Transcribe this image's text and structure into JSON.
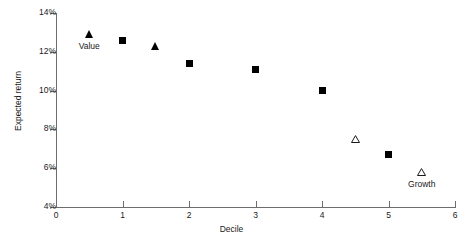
{
  "chart_data": {
    "type": "scatter",
    "title": "",
    "xlabel": "Decile",
    "ylabel": "Expected return",
    "xlim": [
      0,
      6
    ],
    "ylim": [
      4,
      14
    ],
    "xticks": [
      "0",
      "1",
      "2",
      "3",
      "4",
      "5",
      "6"
    ],
    "yticks": [
      "4%",
      "6%",
      "8%",
      "10%",
      "12%",
      "14%"
    ],
    "grid": false,
    "legend": "none",
    "series": [
      {
        "name": "Value",
        "marker": "filled-triangle",
        "color": "#000000",
        "points": [
          {
            "x": 0.5,
            "y": 12.9
          },
          {
            "x": 1.5,
            "y": 12.3
          }
        ]
      },
      {
        "name": "Blend",
        "marker": "filled-square",
        "color": "#000000",
        "points": [
          {
            "x": 1.0,
            "y": 12.6
          },
          {
            "x": 2.0,
            "y": 11.4
          },
          {
            "x": 3.0,
            "y": 11.1
          },
          {
            "x": 4.0,
            "y": 10.0
          },
          {
            "x": 5.0,
            "y": 6.7
          }
        ]
      },
      {
        "name": "Growth",
        "marker": "open-triangle",
        "color": "#000000",
        "points": [
          {
            "x": 4.5,
            "y": 7.5
          },
          {
            "x": 5.5,
            "y": 5.8
          }
        ]
      }
    ],
    "annotations": [
      {
        "text": "Value",
        "x": 0.5,
        "y": 12.9,
        "position": "below"
      },
      {
        "text": "Growth",
        "x": 5.5,
        "y": 5.8,
        "position": "below"
      }
    ]
  },
  "axes": {
    "y_title": "Expected return",
    "x_title": "Decile",
    "y_ticks": [
      {
        "label": "14%",
        "value": 14
      },
      {
        "label": "12%",
        "value": 12
      },
      {
        "label": "10%",
        "value": 10
      },
      {
        "label": "8%",
        "value": 8
      },
      {
        "label": "6%",
        "value": 6
      },
      {
        "label": "4%",
        "value": 4
      }
    ],
    "x_ticks": [
      {
        "label": "0",
        "value": 0
      },
      {
        "label": "1",
        "value": 1
      },
      {
        "label": "2",
        "value": 2
      },
      {
        "label": "3",
        "value": 3
      },
      {
        "label": "4",
        "value": 4
      },
      {
        "label": "5",
        "value": 5
      },
      {
        "label": "6",
        "value": 6
      }
    ]
  },
  "colors": {
    "marker": "#000000",
    "axis": "#6d6d6d",
    "text": "#1a1a1a",
    "background": "#ffffff"
  }
}
